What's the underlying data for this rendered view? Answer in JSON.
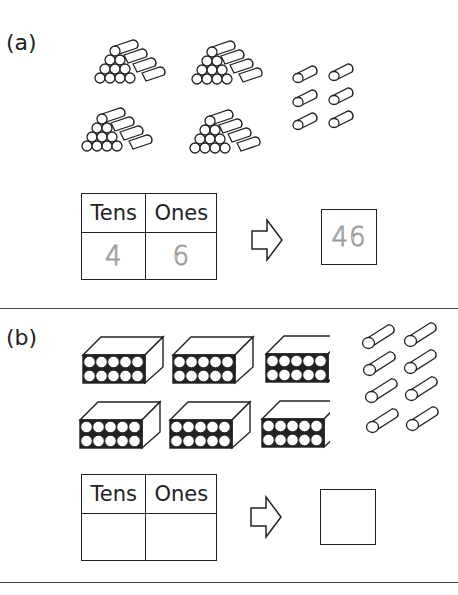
{
  "part_a": {
    "label": "(a)",
    "log_bundles": {
      "count": 4,
      "logs_per_bundle": 10,
      "arrangement": "triangular stack 4-3-2-1"
    },
    "loose_logs": {
      "count": 6
    },
    "table": {
      "headers": [
        "Tens",
        "Ones"
      ],
      "values": [
        "4",
        "6"
      ],
      "value_style": "dotted trace"
    },
    "arrow": "right-arrow",
    "answer": {
      "value": "46",
      "value_style": "dotted trace"
    }
  },
  "part_b": {
    "label": "(b)",
    "crates": {
      "count": 6,
      "cans_per_crate": 10,
      "arrangement": "2 rows of 5"
    },
    "loose_cans": {
      "count": 8
    },
    "table": {
      "headers": [
        "Tens",
        "Ones"
      ],
      "values": [
        "",
        ""
      ]
    },
    "arrow": "right-arrow",
    "answer": {
      "value": ""
    }
  }
}
